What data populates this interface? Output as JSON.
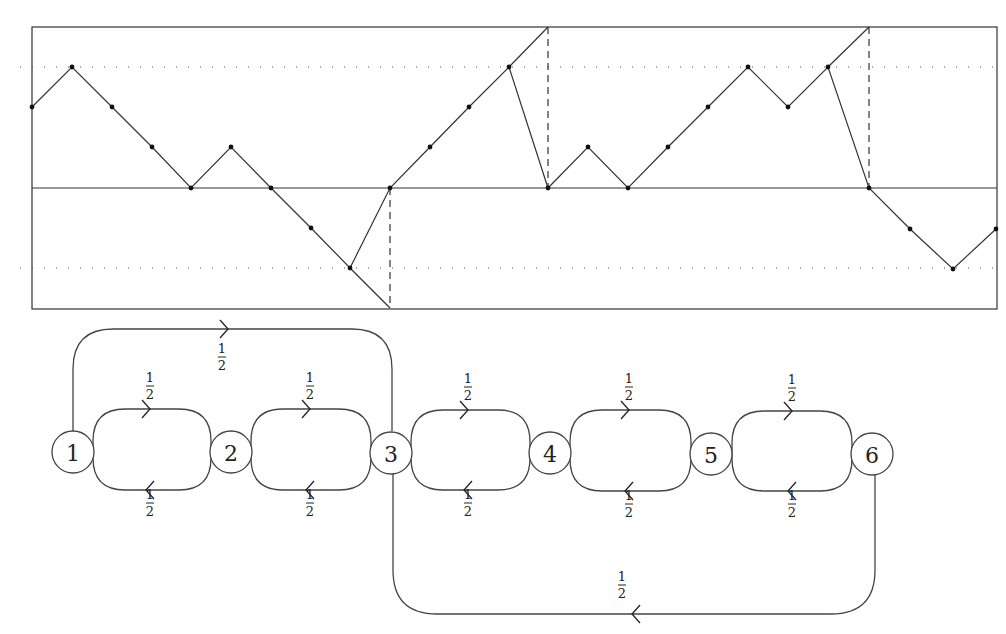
{
  "figure": {
    "top_panel": {
      "description": "Lattice path with up/down steps of unit size",
      "frame": {
        "x0": 32,
        "y0": 27,
        "x1": 997,
        "y1": 309
      },
      "baseline_y": 188,
      "dotted_levels_y": [
        67,
        268
      ],
      "step_px": 40,
      "path_points": [
        [
          32,
          107
        ],
        [
          72,
          67
        ],
        [
          112,
          107
        ],
        [
          152,
          147
        ],
        [
          191,
          188
        ],
        [
          231,
          147
        ],
        [
          271,
          188
        ],
        [
          311,
          228
        ],
        [
          350,
          268
        ],
        [
          390,
          188
        ],
        [
          430,
          147
        ],
        [
          469,
          107
        ],
        [
          509,
          67
        ],
        [
          548,
          188
        ],
        [
          588,
          147
        ],
        [
          628,
          188
        ],
        [
          668,
          147
        ],
        [
          708,
          107
        ],
        [
          748,
          67
        ],
        [
          788,
          107
        ],
        [
          828,
          67
        ],
        [
          869,
          188
        ],
        [
          910,
          229
        ],
        [
          953,
          269
        ],
        [
          996,
          229
        ]
      ],
      "extension_segments": [
        [
          [
            350,
            268
          ],
          [
            390,
            308
          ]
        ],
        [
          [
            509,
            67
          ],
          [
            548,
            27
          ]
        ],
        [
          [
            828,
            67
          ],
          [
            869,
            27
          ]
        ]
      ],
      "dashed_verticals": [
        {
          "x": 390,
          "y0": 188,
          "y1": 308
        },
        {
          "x": 548,
          "y0": 27,
          "y1": 188
        },
        {
          "x": 869,
          "y0": 27,
          "y1": 188
        }
      ]
    },
    "bottom_panel": {
      "description": "Markov chain with six states",
      "nodes": [
        {
          "id": "1",
          "label": "1",
          "cx": 73,
          "cy": 452
        },
        {
          "id": "2",
          "label": "2",
          "cx": 231,
          "cy": 452
        },
        {
          "id": "3",
          "label": "3",
          "cx": 391,
          "cy": 453
        },
        {
          "id": "4",
          "label": "4",
          "cx": 550,
          "cy": 453
        },
        {
          "id": "5",
          "label": "5",
          "cx": 711,
          "cy": 454
        },
        {
          "id": "6",
          "label": "6",
          "cx": 872,
          "cy": 454
        }
      ],
      "node_radius": 21,
      "loops": [
        {
          "from": "1",
          "to": "2",
          "x0": 93,
          "x1": 211,
          "top": 409,
          "bottom": 490,
          "prob_forward": {
            "num": "1",
            "den": "2"
          },
          "prob_back": {
            "num": "1",
            "den": "2"
          },
          "arrow_x": 150
        },
        {
          "from": "2",
          "to": "3",
          "x0": 251,
          "x1": 371,
          "top": 409,
          "bottom": 490,
          "prob_forward": {
            "num": "1",
            "den": "2"
          },
          "prob_back": {
            "num": "1",
            "den": "2"
          },
          "arrow_x": 310
        },
        {
          "from": "3",
          "to": "4",
          "x0": 411,
          "x1": 530,
          "top": 410,
          "bottom": 490,
          "prob_forward": {
            "num": "1",
            "den": "2"
          },
          "prob_back": {
            "num": "1",
            "den": "2"
          },
          "arrow_x": 468
        },
        {
          "from": "4",
          "to": "5",
          "x0": 570,
          "x1": 691,
          "top": 410,
          "bottom": 491,
          "prob_forward": {
            "num": "1",
            "den": "2"
          },
          "prob_back": {
            "num": "1",
            "den": "2"
          },
          "arrow_x": 629
        },
        {
          "from": "5",
          "to": "6",
          "x0": 732,
          "x1": 852,
          "top": 411,
          "bottom": 491,
          "prob_forward": {
            "num": "1",
            "den": "2"
          },
          "prob_back": {
            "num": "1",
            "den": "2"
          },
          "arrow_x": 792
        }
      ],
      "long_edges": [
        {
          "from": "1",
          "to": "3",
          "side": "top",
          "y": 329,
          "x_left": 73,
          "x_right": 392,
          "radius": 40,
          "arrow_x": 228,
          "direction": "right",
          "prob": {
            "num": "1",
            "den": "2"
          },
          "label_x": 222,
          "label_y": 342
        },
        {
          "from": "6",
          "to": "3",
          "side": "bottom",
          "y": 614,
          "x_left": 393,
          "x_right": 875,
          "radius": 44,
          "arrow_x": 632,
          "direction": "left",
          "prob": {
            "num": "1",
            "den": "2"
          },
          "label_x": 622,
          "label_y": 570
        }
      ]
    }
  }
}
